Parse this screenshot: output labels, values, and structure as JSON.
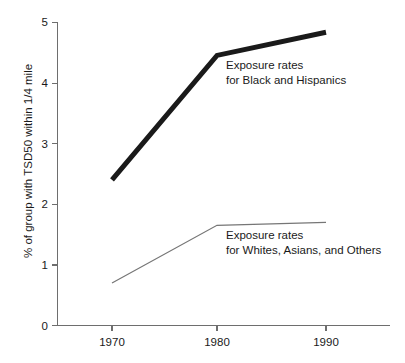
{
  "chart_data": {
    "type": "line",
    "title": "",
    "subtitle": "",
    "xlabel": "",
    "ylabel": "% of group with TSD50 within 1/4 mile",
    "x": [
      1970,
      1980,
      1990
    ],
    "xticklabels": [
      "1970",
      "1980",
      "1990"
    ],
    "yticklabels": [
      "0",
      "1",
      "2",
      "3",
      "4",
      "5"
    ],
    "yticks": [
      0,
      1,
      2,
      3,
      4,
      5
    ],
    "xlim": [
      1965,
      1995
    ],
    "ylim": [
      0,
      5
    ],
    "grid": false,
    "legend": "annotations-inline",
    "series": [
      {
        "name": "Exposure rates for Black and Hispanics",
        "values": [
          2.4,
          4.45,
          4.83
        ],
        "style": "thick",
        "color": "#1a1a1a"
      },
      {
        "name": "Exposure rates for Whites, Asians, and Others",
        "values": [
          0.7,
          1.65,
          1.7
        ],
        "style": "thin",
        "color": "#767676"
      }
    ],
    "annotations": [
      {
        "line1": "Exposure rates",
        "line2": "for Black and Hispanics"
      },
      {
        "line1": "Exposure rates",
        "line2": "for Whites, Asians, and Others"
      }
    ]
  },
  "axes": {
    "y_title": "% of group with TSD50 within 1/4 mile",
    "y_ticks": [
      "5",
      "4",
      "3",
      "2",
      "1",
      "0"
    ],
    "x_ticks": [
      "1970",
      "1980",
      "1990"
    ]
  },
  "annotations": {
    "upper": {
      "line1": "Exposure rates",
      "line2": "for Black and Hispanics"
    },
    "lower": {
      "line1": "Exposure rates",
      "line2": "for Whites, Asians, and Others"
    }
  },
  "colors": {
    "thick_series": "#1a1a1a",
    "thin_series": "#767676",
    "axis": "#6e6e6e",
    "background": "#ffffff"
  }
}
